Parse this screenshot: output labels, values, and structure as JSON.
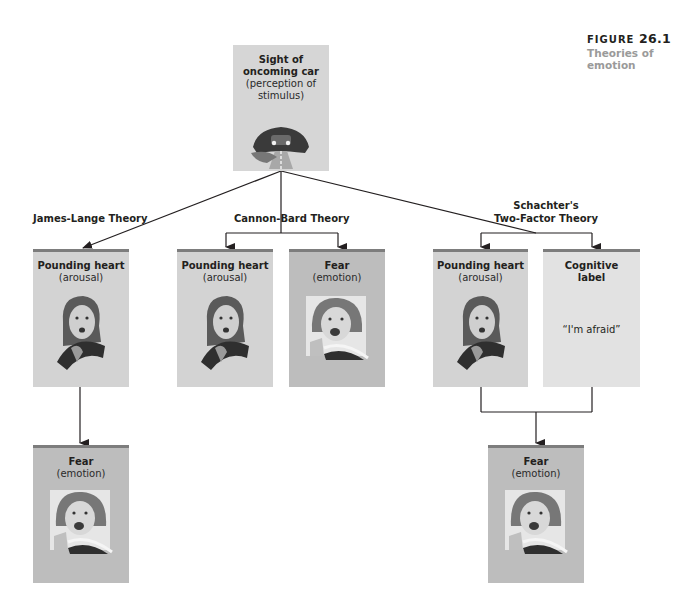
{
  "figure": {
    "label": "FIGURE",
    "number": "26.1",
    "title": "Theories of emotion"
  },
  "stimulus": {
    "title": "Sight of oncoming car",
    "subtitle": "(perception of stimulus)",
    "image": "car-headlights-on-road"
  },
  "theories": [
    {
      "name": "James-Lange Theory",
      "boxes": [
        {
          "title": "Pounding heart",
          "subtitle": "(arousal)",
          "image": "startled-driver-face"
        },
        {
          "title": "Fear",
          "subtitle": "(emotion)",
          "image": "screaming-driver-face"
        }
      ]
    },
    {
      "name": "Cannon-Bard Theory",
      "boxes": [
        {
          "title": "Pounding heart",
          "subtitle": "(arousal)",
          "image": "startled-driver-face"
        },
        {
          "title": "Fear",
          "subtitle": "(emotion)",
          "image": "screaming-driver-face"
        }
      ]
    },
    {
      "name_line1": "Schachter's",
      "name_line2": "Two-Factor Theory",
      "boxes": [
        {
          "title": "Pounding heart",
          "subtitle": "(arousal)",
          "image": "startled-driver-face"
        },
        {
          "title_line1": "Cognitive",
          "title_line2": "label",
          "quote": "“I'm afraid”"
        },
        {
          "title": "Fear",
          "subtitle": "(emotion)",
          "image": "screaming-driver-face"
        }
      ]
    }
  ],
  "colors": {
    "box_fill": "#d3d3d3",
    "box_fill_dark": "#bdbdbd",
    "box_fill_light": "#e2e2e2",
    "box_top_border": "#7d7d7d",
    "caption_gray": "#9a9a9a",
    "line": "#231f20"
  }
}
